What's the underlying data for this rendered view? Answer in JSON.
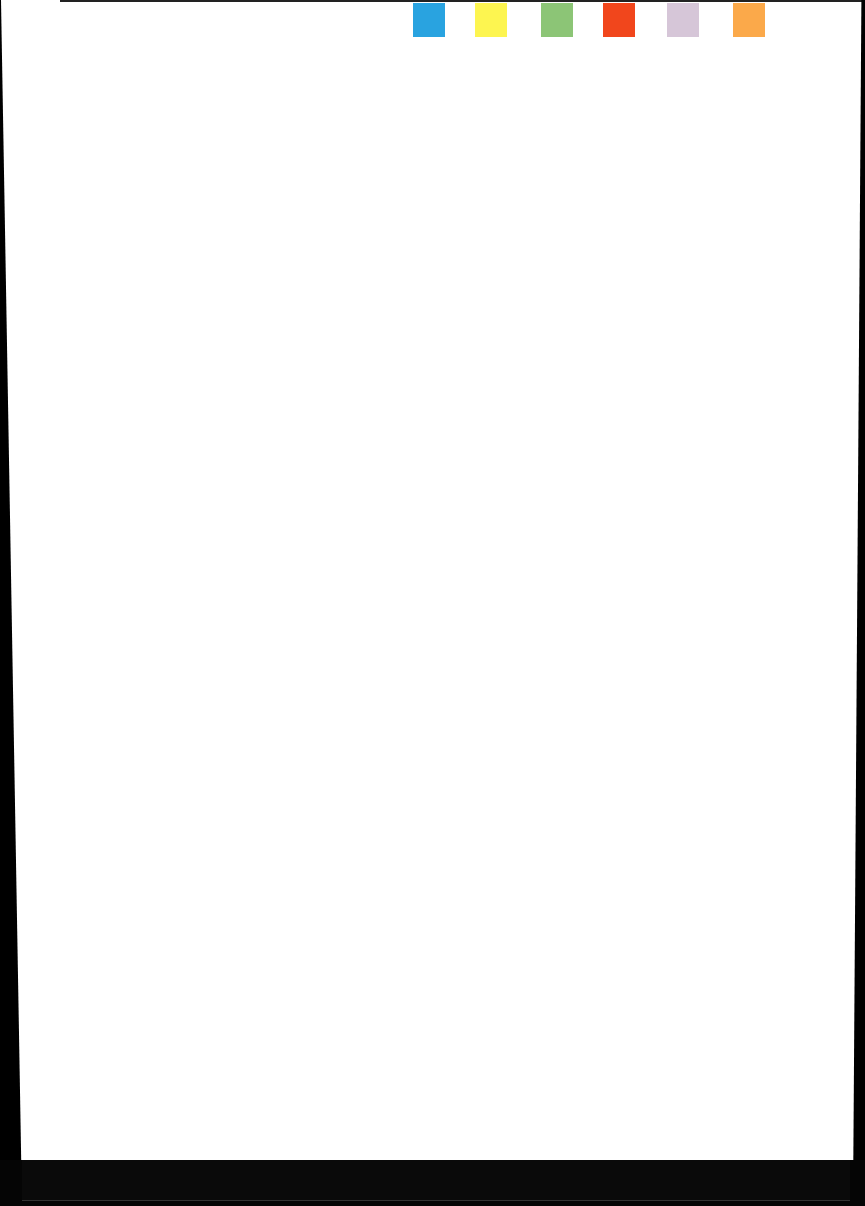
{
  "document": {
    "type": "blank scanned page",
    "color_tabs": [
      {
        "name": "blue",
        "color": "#29a3e0",
        "left": 413
      },
      {
        "name": "yellow",
        "color": "#fdf550",
        "left": 475
      },
      {
        "name": "green",
        "color": "#8cc576",
        "left": 541
      },
      {
        "name": "red",
        "color": "#f1461c",
        "left": 603
      },
      {
        "name": "lavender",
        "color": "#d6c6d8",
        "left": 667
      },
      {
        "name": "orange",
        "color": "#fba94a",
        "left": 733
      }
    ]
  }
}
